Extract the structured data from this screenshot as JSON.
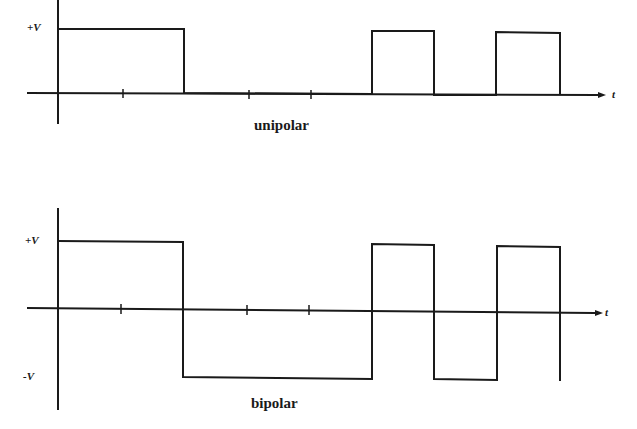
{
  "diagrams": {
    "unipolar": {
      "caption": "unipolar",
      "levels": {
        "plus": "+V"
      },
      "axis_label": "t",
      "bits": [
        1,
        1,
        0,
        0,
        0,
        1,
        0,
        1
      ],
      "ticks": 9
    },
    "bipolar": {
      "caption": "bipolar",
      "levels": {
        "plus": "+V",
        "minus": "-V"
      },
      "axis_label": "t",
      "bits": [
        1,
        1,
        0,
        0,
        0,
        1,
        0,
        1
      ],
      "ticks": 9
    }
  },
  "colors": {
    "stroke": "#1a1a1a",
    "background": "#ffffff"
  }
}
